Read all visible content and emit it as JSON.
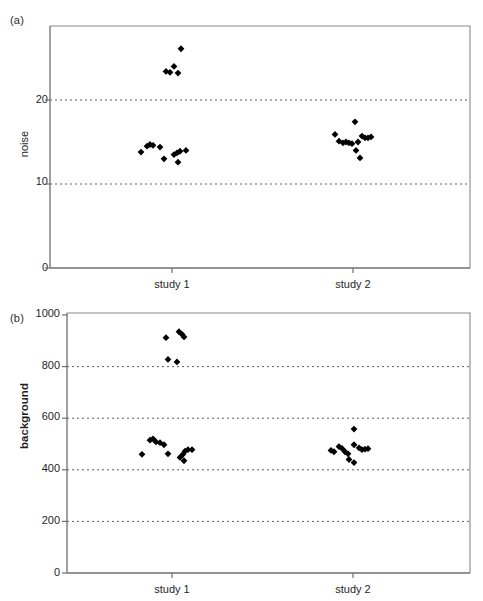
{
  "figure": {
    "panels": [
      {
        "id": "a",
        "label": "(a)",
        "ylabel": "noise",
        "yticks": [
          "0",
          "10",
          "20"
        ],
        "xticks": [
          "study 1",
          "study 2"
        ]
      },
      {
        "id": "b",
        "label": "(b)",
        "ylabel": "background",
        "yticks": [
          "0",
          "200",
          "400",
          "600",
          "800",
          "1000"
        ],
        "xticks": [
          "study 1",
          "study 2"
        ]
      }
    ]
  },
  "chart_data": [
    {
      "type": "scatter",
      "panel": "(a)",
      "title": "",
      "xlabel": "",
      "ylabel": "noise",
      "ylim": [
        0,
        27.5
      ],
      "yticks": [
        0,
        10,
        20
      ],
      "grid": true,
      "grid_at": [
        10,
        20
      ],
      "legend": "none",
      "categories": [
        "study 1",
        "study 2"
      ],
      "category_x": [
        172,
        353
      ],
      "marker": "filled-diamond",
      "marker_color": "#000000",
      "series": [
        {
          "name": "study 1",
          "points": [
            {
              "x_offset": -6,
              "y": 23.4
            },
            {
              "x_offset": -2,
              "y": 23.3
            },
            {
              "x_offset": 2,
              "y": 24.0
            },
            {
              "x_offset": 6,
              "y": 23.2
            },
            {
              "x_offset": 9,
              "y": 26.1
            },
            {
              "x_offset": -31,
              "y": 13.8
            },
            {
              "x_offset": -25,
              "y": 14.5
            },
            {
              "x_offset": -22,
              "y": 14.7
            },
            {
              "x_offset": -19,
              "y": 14.6
            },
            {
              "x_offset": -12,
              "y": 14.4
            },
            {
              "x_offset": -8,
              "y": 13.0
            },
            {
              "x_offset": 2,
              "y": 13.5
            },
            {
              "x_offset": 5,
              "y": 13.7
            },
            {
              "x_offset": 8,
              "y": 13.9
            },
            {
              "x_offset": 6,
              "y": 12.6
            },
            {
              "x_offset": 14,
              "y": 14.0
            }
          ]
        },
        {
          "name": "study 2",
          "points": [
            {
              "x_offset": -18,
              "y": 15.9
            },
            {
              "x_offset": -14,
              "y": 15.1
            },
            {
              "x_offset": -10,
              "y": 14.9
            },
            {
              "x_offset": -7,
              "y": 15.0
            },
            {
              "x_offset": -4,
              "y": 14.9
            },
            {
              "x_offset": -1,
              "y": 14.8
            },
            {
              "x_offset": 2,
              "y": 17.4
            },
            {
              "x_offset": 5,
              "y": 15.0
            },
            {
              "x_offset": 9,
              "y": 15.7
            },
            {
              "x_offset": 12,
              "y": 15.5
            },
            {
              "x_offset": 15,
              "y": 15.5
            },
            {
              "x_offset": 18,
              "y": 15.6
            },
            {
              "x_offset": 3,
              "y": 14.0
            },
            {
              "x_offset": 7,
              "y": 13.1
            }
          ]
        }
      ]
    },
    {
      "type": "scatter",
      "panel": "(b)",
      "title": "",
      "xlabel": "",
      "ylabel": "background",
      "ylim": [
        0,
        1030
      ],
      "yticks": [
        0,
        200,
        400,
        600,
        800,
        1000
      ],
      "grid": true,
      "grid_at": [
        200,
        400,
        600,
        800
      ],
      "legend": "none",
      "categories": [
        "study 1",
        "study 2"
      ],
      "category_x": [
        172,
        353
      ],
      "marker": "filled-diamond",
      "marker_color": "#000000",
      "series": [
        {
          "name": "study 1",
          "points": [
            {
              "x_offset": -6,
              "y": 912
            },
            {
              "x_offset": 7,
              "y": 935
            },
            {
              "x_offset": 10,
              "y": 925
            },
            {
              "x_offset": 12,
              "y": 915
            },
            {
              "x_offset": -4,
              "y": 828
            },
            {
              "x_offset": 5,
              "y": 818
            },
            {
              "x_offset": -30,
              "y": 460
            },
            {
              "x_offset": -22,
              "y": 515
            },
            {
              "x_offset": -19,
              "y": 520
            },
            {
              "x_offset": -16,
              "y": 508
            },
            {
              "x_offset": -12,
              "y": 505
            },
            {
              "x_offset": -8,
              "y": 497
            },
            {
              "x_offset": -4,
              "y": 462
            },
            {
              "x_offset": 8,
              "y": 448
            },
            {
              "x_offset": 11,
              "y": 460
            },
            {
              "x_offset": 13,
              "y": 472
            },
            {
              "x_offset": 16,
              "y": 478
            },
            {
              "x_offset": 20,
              "y": 478
            },
            {
              "x_offset": 12,
              "y": 435
            }
          ]
        },
        {
          "name": "study 2",
          "points": [
            {
              "x_offset": 1,
              "y": 558
            },
            {
              "x_offset": -22,
              "y": 475
            },
            {
              "x_offset": -19,
              "y": 470
            },
            {
              "x_offset": -14,
              "y": 490
            },
            {
              "x_offset": -11,
              "y": 483
            },
            {
              "x_offset": -8,
              "y": 470
            },
            {
              "x_offset": -5,
              "y": 462
            },
            {
              "x_offset": 1,
              "y": 497
            },
            {
              "x_offset": 6,
              "y": 485
            },
            {
              "x_offset": 9,
              "y": 478
            },
            {
              "x_offset": 12,
              "y": 480
            },
            {
              "x_offset": 15,
              "y": 482
            },
            {
              "x_offset": -4,
              "y": 440
            },
            {
              "x_offset": 1,
              "y": 428
            }
          ]
        }
      ]
    }
  ]
}
